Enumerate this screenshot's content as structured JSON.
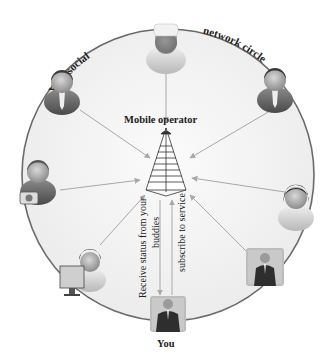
{
  "diagram": {
    "circle_title_left": "Your social",
    "circle_title_right": "network circle",
    "center_label": "Mobile operator",
    "you_label": "You",
    "arrow_label_up": "Receive status from your",
    "arrow_label_mid": "buddies",
    "arrow_label_down": "subscribe to service",
    "nodes": [
      {
        "id": "top",
        "icon": "chef-person-icon"
      },
      {
        "id": "upper-left",
        "icon": "businessman-icon"
      },
      {
        "id": "upper-right",
        "icon": "businessman-icon"
      },
      {
        "id": "left",
        "icon": "photographer-icon"
      },
      {
        "id": "right",
        "icon": "woman-icon"
      },
      {
        "id": "lower-left",
        "icon": "computer-user-icon"
      },
      {
        "id": "lower-right",
        "icon": "businessman-photo-icon"
      },
      {
        "id": "bottom-you",
        "icon": "you-photo-icon"
      }
    ],
    "colors": {
      "circle_fill": "#f4f4f4",
      "circle_stroke": "#6a6a6a",
      "arrow": "#a8a8a8",
      "text": "#222222"
    }
  }
}
